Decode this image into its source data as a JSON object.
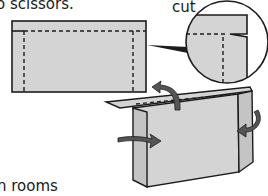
{
  "texts": {
    "top_fragment": "o scissors.",
    "cut_label": "cut",
    "bottom_fragment": "n rooms"
  },
  "colors": {
    "paper_fill": "#d4d4d4",
    "outline": "#1c1c1c",
    "arrow_fill": "#555555",
    "background": "#ffffff"
  },
  "figures": [
    {
      "id": "flat-sheet",
      "description": "flat rectangle with dashed fold lines along top and sides"
    },
    {
      "id": "cut-detail-magnifier",
      "description": "circle magnifying the corner cut"
    },
    {
      "id": "folded-stand",
      "description": "3D folded sheet with curved arrows showing fold directions"
    }
  ]
}
